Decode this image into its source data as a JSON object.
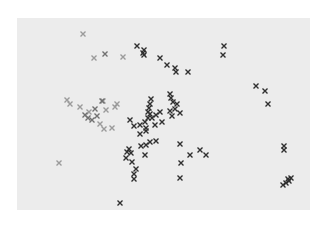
{
  "chart_data": {
    "type": "scatter",
    "title": "",
    "xlabel": "",
    "ylabel": "",
    "grid": false,
    "legend": null,
    "axes_visible": false,
    "coordinate_note": "x and y in percent of plot area (0-100); y measured from top",
    "plot_background": "#ececec",
    "marker": "x",
    "series": [
      {
        "name": "light",
        "color": "#9a9a9a",
        "points": [
          [
            22.5,
            8.3
          ],
          [
            26.3,
            20.8
          ],
          [
            36.2,
            20.3
          ],
          [
            17.1,
            42.7
          ],
          [
            18.1,
            44.8
          ],
          [
            21.5,
            46.4
          ],
          [
            24.6,
            49.0
          ],
          [
            29.4,
            43.2
          ],
          [
            30.4,
            47.9
          ],
          [
            33.4,
            46.4
          ],
          [
            34.1,
            44.8
          ],
          [
            28.3,
            55.2
          ],
          [
            32.4,
            57.3
          ],
          [
            29.7,
            57.8
          ],
          [
            14.3,
            75.5
          ]
        ]
      },
      {
        "name": "medium",
        "color": "#707070",
        "points": [
          [
            30.0,
            18.8
          ],
          [
            23.2,
            50.5
          ],
          [
            24.2,
            52.1
          ],
          [
            25.6,
            53.1
          ],
          [
            27.3,
            51.0
          ],
          [
            29.0,
            43.2
          ],
          [
            26.6,
            47.4
          ]
        ]
      },
      {
        "name": "dark",
        "color": "#2e2e2e",
        "points": [
          [
            40.9,
            14.6
          ],
          [
            43.3,
            16.7
          ],
          [
            43.0,
            18.2
          ],
          [
            43.3,
            19.3
          ],
          [
            48.8,
            20.8
          ],
          [
            51.2,
            24.5
          ],
          [
            53.9,
            26.0
          ],
          [
            54.3,
            28.1
          ],
          [
            58.4,
            28.1
          ],
          [
            45.7,
            42.2
          ],
          [
            45.4,
            44.8
          ],
          [
            45.1,
            46.9
          ],
          [
            44.7,
            49.0
          ],
          [
            45.4,
            50.0
          ],
          [
            44.7,
            52.1
          ],
          [
            43.7,
            54.2
          ],
          [
            46.1,
            52.1
          ],
          [
            47.4,
            50.5
          ],
          [
            48.8,
            49.0
          ],
          [
            47.1,
            55.7
          ],
          [
            49.5,
            54.2
          ],
          [
            52.2,
            48.4
          ],
          [
            52.9,
            51.0
          ],
          [
            54.6,
            44.8
          ],
          [
            53.9,
            47.4
          ],
          [
            52.2,
            39.6
          ],
          [
            52.6,
            41.7
          ],
          [
            53.2,
            43.8
          ],
          [
            55.6,
            49.5
          ],
          [
            38.6,
            53.1
          ],
          [
            39.9,
            56.3
          ],
          [
            41.9,
            55.7
          ],
          [
            44.0,
            57.3
          ],
          [
            41.9,
            60.4
          ],
          [
            44.0,
            58.9
          ],
          [
            45.4,
            64.6
          ],
          [
            38.2,
            68.2
          ],
          [
            37.5,
            69.8
          ],
          [
            38.9,
            70.3
          ],
          [
            37.2,
            72.9
          ],
          [
            42.3,
            66.7
          ],
          [
            44.0,
            66.1
          ],
          [
            47.4,
            64.1
          ],
          [
            43.7,
            71.4
          ],
          [
            39.2,
            75.0
          ],
          [
            40.6,
            78.6
          ],
          [
            39.9,
            81.3
          ],
          [
            39.9,
            83.9
          ],
          [
            55.6,
            65.6
          ],
          [
            62.5,
            68.8
          ],
          [
            59.0,
            71.4
          ],
          [
            64.5,
            71.4
          ],
          [
            56.0,
            75.5
          ],
          [
            55.6,
            83.3
          ],
          [
            35.2,
            96.4
          ],
          [
            70.6,
            14.6
          ],
          [
            70.3,
            19.3
          ],
          [
            81.6,
            35.4
          ],
          [
            84.6,
            38.0
          ],
          [
            85.7,
            44.8
          ],
          [
            91.1,
            66.7
          ],
          [
            91.1,
            68.8
          ],
          [
            90.8,
            87.0
          ],
          [
            91.8,
            85.9
          ],
          [
            92.8,
            84.9
          ],
          [
            93.5,
            83.3
          ],
          [
            92.5,
            83.9
          ]
        ]
      }
    ]
  }
}
